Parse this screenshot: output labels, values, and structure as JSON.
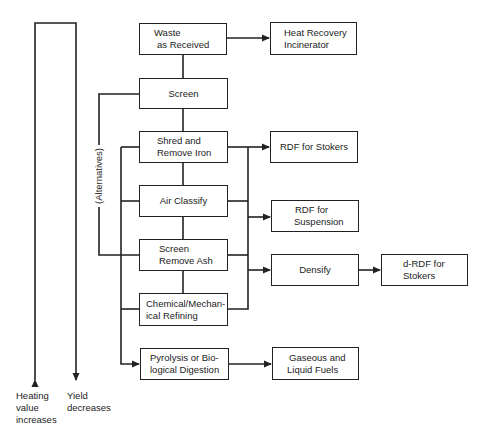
{
  "diagram": {
    "type": "process flowchart",
    "nodes": {
      "waste": {
        "line1": "Waste",
        "line2": "as Received"
      },
      "screen": {
        "line1": "Screen"
      },
      "shred": {
        "line1": "Shred and",
        "line2": "Remove Iron"
      },
      "air": {
        "line1": "Air Classify"
      },
      "screen_ash": {
        "line1": "Screen",
        "line2": "Remove Ash"
      },
      "chemical": {
        "line1": "Chemical/Mechan-",
        "line2": "ical Refining"
      },
      "pyrolysis": {
        "line1": "Pyrolysis or Bio-",
        "line2": "logical Digestion"
      },
      "heat": {
        "line1": "Heat Recovery",
        "line2": "Incinerator"
      },
      "rdf_stokers": {
        "line1": "RDF for Stokers"
      },
      "rdf_suspension": {
        "line1": "RDF for",
        "line2": "Suspension"
      },
      "densify": {
        "line1": "Densify"
      },
      "drdf": {
        "line1": "d-RDF for",
        "line2": "Stokers"
      },
      "fuels": {
        "line1": "Gaseous and",
        "line2": "Liquid Fuels"
      }
    },
    "edges": [
      {
        "from": "Waste as Received",
        "to": "Heat Recovery Incinerator"
      },
      {
        "from": "Waste as Received",
        "to": "Screen"
      },
      {
        "from": "Screen",
        "to": "Shred and Remove Iron"
      },
      {
        "from": "Shred and Remove Iron",
        "to": "Air Classify"
      },
      {
        "from": "Air Classify",
        "to": "Screen Remove Ash"
      },
      {
        "from": "Screen Remove Ash",
        "to": "Chemical/Mechanical Refining"
      },
      {
        "from": "Processing stages",
        "to": "RDF for Stokers"
      },
      {
        "from": "Processing stages",
        "to": "RDF for Suspension"
      },
      {
        "from": "Processing stages",
        "to": "Densify"
      },
      {
        "from": "Densify",
        "to": "d-RDF for Stokers"
      },
      {
        "from": "Processing stages",
        "to": "Pyrolysis or Biological Digestion"
      },
      {
        "from": "Pyrolysis or Biological Digestion",
        "to": "Gaseous and Liquid Fuels"
      }
    ],
    "bracket_label": "(Alternatives)",
    "axis_arrows": {
      "heating": {
        "line1": "Heating",
        "line2": "value",
        "line3": "increases"
      },
      "yield": {
        "line1": "Yield",
        "line2": "decreases"
      }
    },
    "colors": {
      "line": "#222222",
      "background": "#ffffff",
      "text": "#1c1c1c"
    }
  }
}
